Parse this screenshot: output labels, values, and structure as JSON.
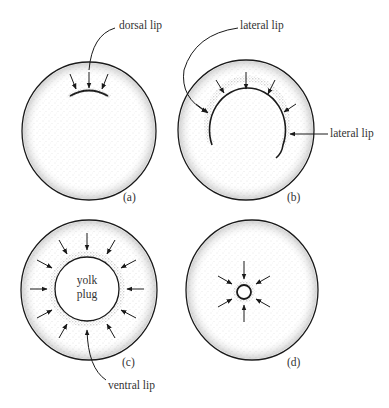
{
  "figure": {
    "panels": [
      {
        "id": "a",
        "label": "(a)",
        "annotations": [
          "dorsal lip"
        ]
      },
      {
        "id": "b",
        "label": "(b)",
        "annotations": [
          "lateral lip",
          "lateral lip"
        ]
      },
      {
        "id": "c",
        "label": "(c)",
        "annotations": [
          "yolk plug",
          "ventral lip"
        ]
      },
      {
        "id": "d",
        "label": "(d)",
        "annotations": []
      }
    ],
    "labels": {
      "dorsal_lip": "dorsal lip",
      "lateral_lip_top": "lateral lip",
      "lateral_lip_right": "lateral lip",
      "yolk": "yolk",
      "plug": "plug",
      "ventral_lip": "ventral lip",
      "panel_a": "(a)",
      "panel_b": "(b)",
      "panel_c": "(c)",
      "panel_d": "(d)"
    },
    "colors": {
      "ink": "#1a1a1a",
      "stipple": "#555555",
      "background": "#ffffff"
    }
  }
}
